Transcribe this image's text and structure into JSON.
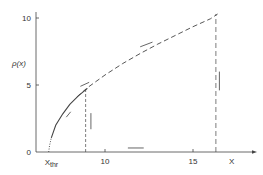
{
  "chart_data": {
    "type": "line",
    "title": "",
    "xlabel": "X",
    "ylabel": "ρ(x)",
    "xlim": [
      6,
      19
    ],
    "ylim": [
      0,
      10.5
    ],
    "grid": false,
    "x_ticks": [
      {
        "value": 10,
        "label": "10"
      },
      {
        "value": 15,
        "label": "15"
      }
    ],
    "x_special_tick": {
      "value": 6.8,
      "label": "X",
      "sub": "thr"
    },
    "y_ticks": [
      {
        "value": 0,
        "label": "0"
      },
      {
        "value": 5,
        "label": "5"
      },
      {
        "value": 10,
        "label": "10"
      }
    ],
    "series": [
      {
        "name": "threshold-onset",
        "style": "dotted",
        "x": [
          6.8,
          6.85,
          6.95
        ],
        "y": [
          0,
          0.5,
          1.05
        ]
      },
      {
        "name": "solid-curve",
        "style": "solid",
        "x": [
          6.95,
          7.2,
          7.6,
          8.0,
          8.5,
          9.0
        ],
        "y": [
          1.05,
          2.0,
          2.85,
          3.55,
          4.2,
          4.75
        ]
      },
      {
        "name": "dashed-curve",
        "style": "dashed",
        "x": [
          8.4,
          9.0,
          10.0,
          11.0,
          12.0,
          13.0,
          14.0,
          15.0,
          16.0,
          16.4
        ],
        "y": [
          4.1,
          4.8,
          5.75,
          6.6,
          7.35,
          8.05,
          8.7,
          9.35,
          9.95,
          10.3
        ]
      }
    ],
    "vertical_lines": [
      {
        "name": "inner-boundary",
        "x": 8.9,
        "y_top": 4.7,
        "style": "dashed"
      },
      {
        "name": "outer-boundary",
        "x": 16.3,
        "y_top": 10.3,
        "style": "dashed"
      }
    ],
    "error_bars": [
      {
        "name": "parallel-mark-1",
        "orientation": "slanted",
        "x": [
          7.8,
          8.05
        ],
        "y": [
          2.6,
          3.0
        ]
      },
      {
        "name": "parallel-mark-2",
        "orientation": "slanted",
        "x": [
          8.6,
          9.1
        ],
        "y": [
          4.9,
          5.2
        ]
      },
      {
        "name": "parallel-mark-3",
        "orientation": "slanted",
        "x": [
          12.0,
          12.7
        ],
        "y": [
          7.85,
          8.2
        ]
      },
      {
        "name": "vertical-bar-1",
        "orientation": "vertical",
        "x": [
          9.2,
          9.2
        ],
        "y": [
          1.7,
          2.9
        ]
      },
      {
        "name": "vertical-bar-2",
        "orientation": "vertical",
        "x": [
          16.5,
          16.5
        ],
        "y": [
          4.6,
          6.0
        ]
      },
      {
        "name": "horizontal-bar-1",
        "orientation": "horizontal",
        "x": [
          11.3,
          12.2
        ],
        "y": [
          0.3,
          0.3
        ]
      }
    ]
  }
}
